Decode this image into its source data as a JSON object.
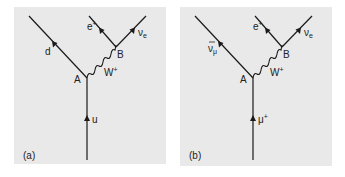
{
  "figure": {
    "panels": [
      {
        "id": "a",
        "caption": "(a)",
        "vertex_a_label": "A",
        "vertex_b_label": "B",
        "incoming": {
          "symbol": "u",
          "sup": "",
          "sub": "",
          "bar": false
        },
        "outgoing_left": {
          "symbol": "d",
          "sup": "",
          "sub": "",
          "bar": false
        },
        "boson": {
          "symbol": "W",
          "sup": "+"
        },
        "lepton_left": {
          "symbol": "e",
          "sup": "+",
          "sub": ""
        },
        "lepton_right": {
          "symbol": "ν",
          "sup": "",
          "sub": "e"
        }
      },
      {
        "id": "b",
        "caption": "(b)",
        "vertex_a_label": "A",
        "vertex_b_label": "B",
        "incoming": {
          "symbol": "μ",
          "sup": "+",
          "sub": "",
          "bar": false
        },
        "outgoing_left": {
          "symbol": "ν",
          "sup": "",
          "sub": "μ",
          "bar": true
        },
        "boson": {
          "symbol": "W",
          "sup": "+"
        },
        "lepton_left": {
          "symbol": "e",
          "sup": "+",
          "sub": ""
        },
        "lepton_right": {
          "symbol": "ν",
          "sup": "",
          "sub": "e"
        }
      }
    ],
    "colors": {
      "panel_background": "#e9e9e9",
      "ink": "#1a1a1a"
    }
  }
}
